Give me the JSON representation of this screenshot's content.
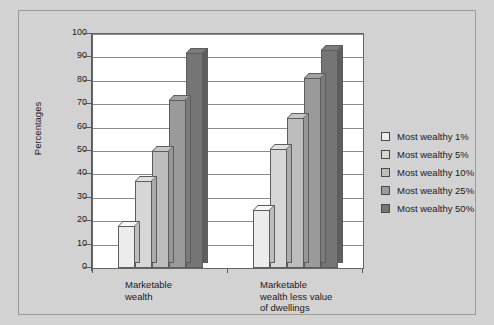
{
  "chart_data": {
    "type": "bar",
    "title": "",
    "xlabel": "",
    "ylabel": "Percentages",
    "ylim": [
      0,
      100
    ],
    "yticks": [
      0,
      10,
      20,
      30,
      40,
      50,
      60,
      70,
      80,
      90,
      100
    ],
    "ytick_labels": [
      "0",
      "10",
      "20",
      "30",
      "40",
      "50",
      "60",
      "70",
      "80",
      "90",
      "100"
    ],
    "grid": true,
    "legend_position": "right",
    "categories": [
      "Marketable wealth",
      "Marketable wealth less value of dwellings"
    ],
    "category_lines": [
      [
        "Marketable",
        "wealth"
      ],
      [
        "Marketable",
        "wealth less value",
        "of dwellings"
      ]
    ],
    "series": [
      {
        "name": "Most wealthy 1%",
        "values": [
          18,
          25
        ],
        "color": "#ececec"
      },
      {
        "name": "Most wealthy 5%",
        "values": [
          37,
          51
        ],
        "color": "#d6d6d6"
      },
      {
        "name": "Most wealthy 10%",
        "values": [
          50,
          64
        ],
        "color": "#bdbdbd"
      },
      {
        "name": "Most wealthy 25%",
        "values": [
          72,
          81
        ],
        "color": "#9a9a9a"
      },
      {
        "name": "Most wealthy 50%",
        "values": [
          92,
          93
        ],
        "color": "#757575"
      }
    ]
  },
  "figure": {
    "background": "#d2d2d2",
    "plot_background": "#ffffff",
    "gridline_color": "#8c8c8c",
    "axis_color": "#5a5a5a"
  }
}
